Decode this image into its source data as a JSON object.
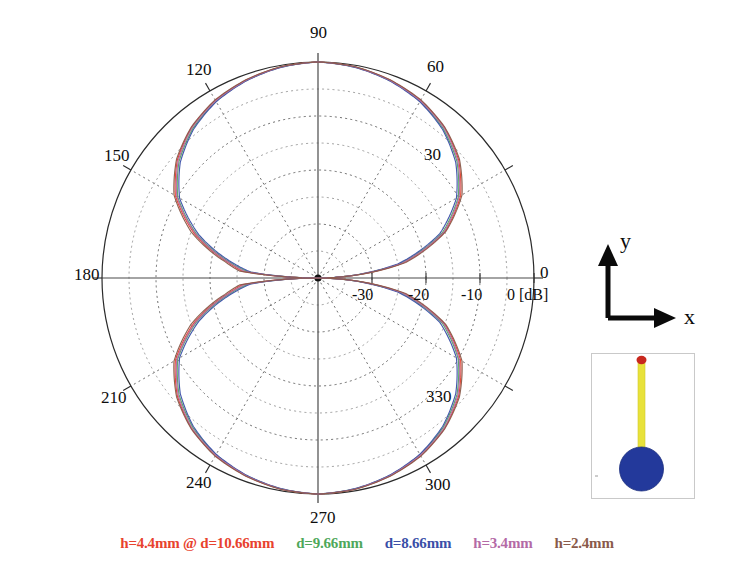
{
  "figure": {
    "title": "",
    "units_label": "0 [dB]"
  },
  "polar": {
    "angle_labels": [
      "0",
      "30",
      "60",
      "90",
      "120",
      "150",
      "180",
      "210",
      "240",
      "270",
      "300",
      "330"
    ],
    "radial_labels": [
      "-30",
      "-20",
      "-10",
      "0"
    ],
    "db_suffix": "[dB]"
  },
  "axes_inset": {
    "y_label": "y",
    "x_label": "x"
  },
  "geometry_inset": {
    "rod_color": "#e8e23a",
    "tip_color": "#c8281e",
    "ground_color": "#23399b",
    "frame_color": "#c9c9c9"
  },
  "legend": {
    "entries": [
      {
        "label": "h=4.4mm @ d=10.66mm",
        "color": "#e8422e"
      },
      {
        "label": "d=9.66mm",
        "color": "#4fa85b"
      },
      {
        "label": "d=8.66mm",
        "color": "#3a4fa8"
      },
      {
        "label": "h=3.4mm",
        "color": "#b46aa6"
      },
      {
        "label": "h=2.4mm",
        "color": "#8a5a4a"
      }
    ]
  },
  "chart_data": {
    "type": "line",
    "title": "",
    "subtitle": "",
    "coordinate_system": "polar",
    "xlabel": "Angle (degrees)",
    "ylabel": "Gain [dB]",
    "rlim": [
      -40,
      0
    ],
    "r_ticks": [
      -30,
      -20,
      -10,
      0
    ],
    "r_tick_labels": [
      "-30",
      "-20",
      "-10",
      "0 [dB]"
    ],
    "theta_ticks": [
      0,
      30,
      60,
      90,
      120,
      150,
      180,
      210,
      240,
      270,
      300,
      330
    ],
    "theta_tick_labels": [
      "0",
      "30",
      "60",
      "90",
      "120",
      "150",
      "180",
      "210",
      "240",
      "270",
      "300",
      "330"
    ],
    "theta_direction": "counterclockwise",
    "theta_zero_location": "E",
    "grid": true,
    "grid_style": "dotted",
    "legend_position": "below",
    "outer_circle_value": 0,
    "center_value": -40,
    "x": [
      0,
      10,
      20,
      30,
      40,
      50,
      60,
      70,
      80,
      90,
      100,
      110,
      120,
      130,
      140,
      150,
      160,
      170,
      175,
      180,
      185,
      190,
      200,
      210,
      220,
      230,
      240,
      250,
      260,
      270,
      280,
      290,
      300,
      310,
      320,
      330,
      340,
      350,
      360
    ],
    "series": [
      {
        "name": "h=4.4mm @ d=10.66mm",
        "color": "#e8422e",
        "values": [
          -40,
          -24,
          -15,
          -9.5,
          -6.0,
          -3.6,
          -2.0,
          -1.0,
          -0.3,
          0.0,
          -0.3,
          -1.0,
          -2.0,
          -3.6,
          -6.0,
          -9.5,
          -15.5,
          -23,
          -26,
          -40,
          -26,
          -23,
          -15.5,
          -9.5,
          -6.0,
          -3.6,
          -2.0,
          -1.0,
          -0.3,
          0.0,
          -0.3,
          -1.0,
          -2.0,
          -3.6,
          -6.0,
          -9.5,
          -15,
          -24,
          -40
        ]
      },
      {
        "name": "d=9.66mm",
        "color": "#4fa85b",
        "values": [
          -40,
          -24.5,
          -15.5,
          -10.0,
          -6.4,
          -3.9,
          -2.2,
          -1.1,
          -0.35,
          0.0,
          -0.35,
          -1.1,
          -2.2,
          -3.9,
          -6.4,
          -10.0,
          -16.0,
          -23.5,
          -27,
          -40,
          -27,
          -23.5,
          -16.0,
          -10.0,
          -6.4,
          -3.9,
          -2.2,
          -1.1,
          -0.35,
          0.0,
          -0.35,
          -1.1,
          -2.2,
          -3.9,
          -6.4,
          -10.0,
          -15.5,
          -24.5,
          -40
        ]
      },
      {
        "name": "d=8.66mm",
        "color": "#3a4fa8",
        "values": [
          -40,
          -25,
          -16,
          -10.4,
          -6.7,
          -4.1,
          -2.3,
          -1.15,
          -0.4,
          0.0,
          -0.4,
          -1.15,
          -2.3,
          -4.1,
          -6.7,
          -10.4,
          -16.5,
          -24,
          -27.5,
          -40,
          -27.5,
          -24,
          -16.5,
          -10.4,
          -6.7,
          -4.1,
          -2.3,
          -1.15,
          -0.4,
          0.0,
          -0.4,
          -1.15,
          -2.3,
          -4.1,
          -6.7,
          -10.4,
          -16,
          -25,
          -40
        ]
      },
      {
        "name": "h=3.4mm",
        "color": "#b46aa6",
        "values": [
          -40,
          -24.2,
          -15.2,
          -9.8,
          -6.2,
          -3.7,
          -2.1,
          -1.05,
          -0.32,
          0.0,
          -0.32,
          -1.05,
          -2.1,
          -3.7,
          -6.2,
          -9.8,
          -15.8,
          -23.2,
          -26.5,
          -40,
          -26.5,
          -23.2,
          -15.8,
          -9.8,
          -6.2,
          -3.7,
          -2.1,
          -1.05,
          -0.32,
          0.0,
          -0.32,
          -1.05,
          -2.1,
          -3.7,
          -6.2,
          -9.8,
          -15.2,
          -24.2,
          -40
        ]
      },
      {
        "name": "h=2.4mm",
        "color": "#8a5a4a",
        "values": [
          -40,
          -23.5,
          -14.8,
          -9.2,
          -5.8,
          -3.5,
          -1.9,
          -0.95,
          -0.28,
          0.0,
          -0.28,
          -0.95,
          -1.9,
          -3.5,
          -5.8,
          -9.2,
          -15.0,
          -22.5,
          -25.5,
          -40,
          -25.5,
          -22.5,
          -15.0,
          -9.2,
          -5.8,
          -3.5,
          -1.9,
          -0.95,
          -0.28,
          0.0,
          -0.28,
          -0.95,
          -1.9,
          -3.5,
          -5.8,
          -9.2,
          -14.8,
          -23.5,
          -40
        ]
      }
    ]
  }
}
